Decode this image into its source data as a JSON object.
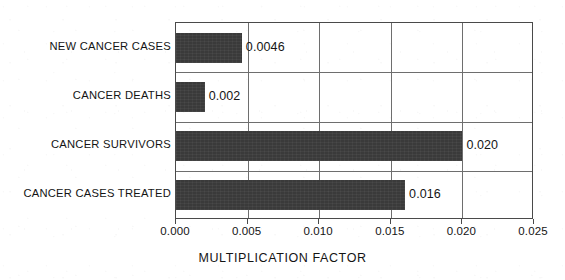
{
  "chart_data": {
    "type": "bar",
    "orientation": "horizontal",
    "title": "",
    "xlabel": "MULTIPLICATION FACTOR",
    "ylabel": "",
    "categories": [
      "NEW CANCER CASES",
      "CANCER DEATHS",
      "CANCER SURVIVORS",
      "CANCER CASES TREATED"
    ],
    "values": [
      0.0046,
      0.002,
      0.02,
      0.016
    ],
    "value_labels": [
      "0.0046",
      "0.002",
      "0.020",
      "0.016"
    ],
    "xlim": [
      0.0,
      0.025
    ],
    "xticks": [
      0.0,
      0.005,
      0.01,
      0.015,
      0.02,
      0.025
    ],
    "xtick_labels": [
      "0.000",
      "0.005",
      "0.010",
      "0.015",
      "0.020",
      "0.025"
    ],
    "grid": {
      "vertical": true,
      "horizontal": true
    },
    "legend": null,
    "bar_color": "#3a3a3a",
    "frame_color": "#4a4a4a",
    "grid_color": "#6e6e6e",
    "background_color": "#ffffff"
  }
}
